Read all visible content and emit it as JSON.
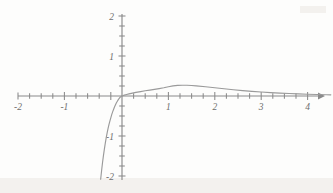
{
  "chart_data": {
    "type": "line",
    "title": "",
    "subtitle": "",
    "xlabel": "",
    "ylabel": "",
    "xlim": [
      -2.35,
      4.55
    ],
    "ylim": [
      -2.15,
      2.15
    ],
    "grid": false,
    "legend": null,
    "x_major_ticks": [
      -2,
      -1,
      1,
      2,
      3,
      4
    ],
    "x_tick_labels": [
      "-2",
      "-1",
      "1",
      "2",
      "3",
      "4"
    ],
    "y_major_ticks": [
      -2,
      -1,
      1,
      2
    ],
    "y_tick_labels": [
      "-2",
      "-1",
      "1",
      "2"
    ],
    "x_minor_tick_step": 0.25,
    "y_minor_tick_step": 0.25,
    "axis_color": "#8a8a8a",
    "curve_color": "#9a9a9a",
    "background_color": "#fdfdfc",
    "series": [
      {
        "name": "curve",
        "x": [
          -0.46,
          -0.44,
          -0.42,
          -0.4,
          -0.38,
          -0.36,
          -0.34,
          -0.32,
          -0.3,
          -0.28,
          -0.26,
          -0.24,
          -0.22,
          -0.2,
          -0.18,
          -0.16,
          -0.14,
          -0.12,
          -0.1,
          -0.08,
          -0.06,
          -0.04,
          -0.02,
          0.0,
          0.05,
          0.1,
          0.15,
          0.2,
          0.3,
          0.4,
          0.5,
          0.6,
          0.7,
          0.8,
          0.9,
          1.0,
          1.1,
          1.2,
          1.3,
          1.4,
          1.5,
          1.6,
          1.8,
          2.0,
          2.2,
          2.4,
          2.6,
          2.8,
          3.0,
          3.2,
          3.4,
          3.6,
          3.8,
          4.0,
          4.2,
          4.4,
          4.5
        ],
        "y": [
          -2.08,
          -1.87,
          -1.67,
          -1.49,
          -1.33,
          -1.18,
          -1.04,
          -0.92,
          -0.81,
          -0.71,
          -0.62,
          -0.54,
          -0.46,
          -0.39,
          -0.33,
          -0.27,
          -0.22,
          -0.17,
          -0.13,
          -0.09,
          -0.06,
          -0.03,
          -0.012,
          0.0,
          0.021,
          0.038,
          0.053,
          0.066,
          0.09,
          0.11,
          0.13,
          0.148,
          0.167,
          0.186,
          0.207,
          0.232,
          0.254,
          0.266,
          0.27,
          0.268,
          0.262,
          0.253,
          0.232,
          0.207,
          0.181,
          0.157,
          0.136,
          0.117,
          0.1,
          0.086,
          0.073,
          0.062,
          0.053,
          0.045,
          0.038,
          0.032,
          0.029
        ]
      }
    ]
  },
  "axes": {
    "x_axis_name": "horizontal-axis",
    "y_axis_name": "vertical-axis"
  }
}
